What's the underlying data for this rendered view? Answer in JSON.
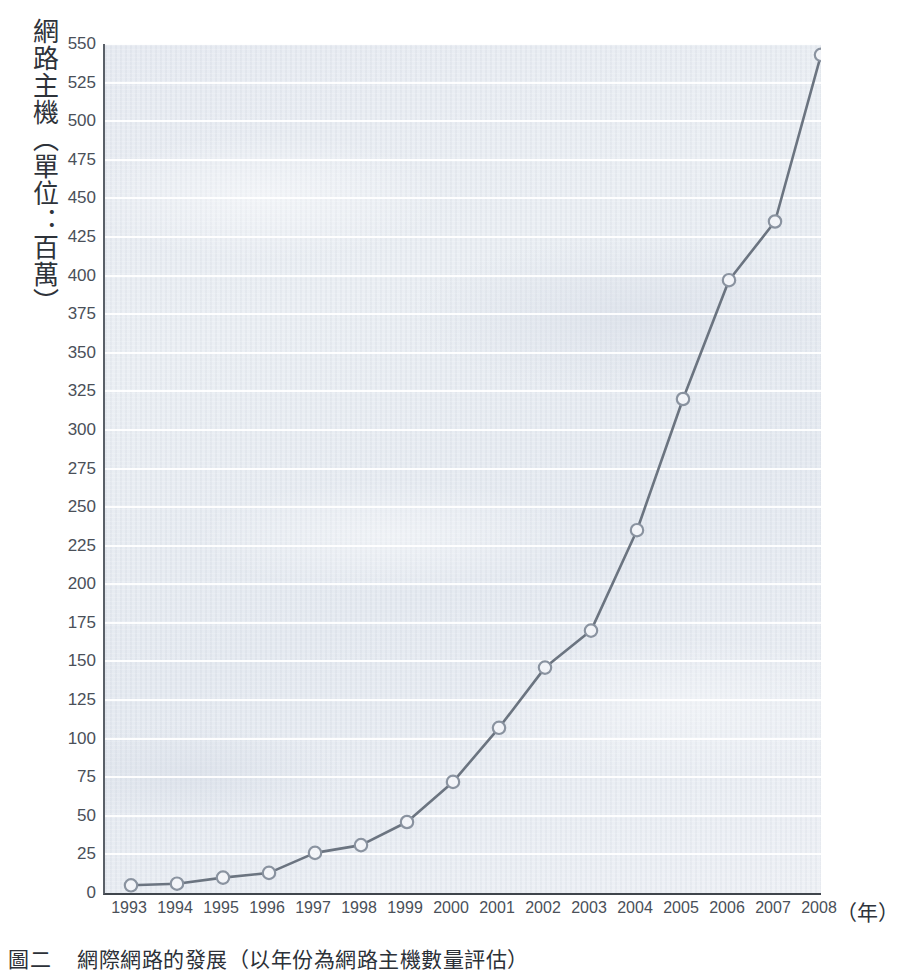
{
  "chart_data": {
    "type": "line",
    "title": "",
    "xlabel": "（年）",
    "ylabel": "網路主機（單位：百萬）",
    "x": [
      1993,
      1994,
      1995,
      1996,
      1997,
      1998,
      1999,
      2000,
      2001,
      2002,
      2003,
      2004,
      2005,
      2006,
      2007,
      2008
    ],
    "categories": [
      "1993",
      "1994",
      "1995",
      "1996",
      "1997",
      "1998",
      "1999",
      "2000",
      "2001",
      "2002",
      "2003",
      "2004",
      "2005",
      "2006",
      "2007",
      "2008"
    ],
    "values": [
      5,
      6,
      10,
      13,
      26,
      31,
      46,
      72,
      107,
      146,
      170,
      235,
      320,
      397,
      435,
      543
    ],
    "series": [
      {
        "name": "網路主機",
        "values": [
          5,
          6,
          10,
          13,
          26,
          31,
          46,
          72,
          107,
          146,
          170,
          235,
          320,
          397,
          435,
          543
        ]
      }
    ],
    "ylim": [
      0,
      550
    ],
    "xlim": [
      1993,
      2008
    ],
    "ytick_step": 25,
    "yticks": [
      0,
      25,
      50,
      75,
      100,
      125,
      150,
      175,
      200,
      225,
      250,
      275,
      300,
      325,
      350,
      375,
      400,
      425,
      450,
      475,
      500,
      525,
      550
    ],
    "ytick_labels": [
      "0",
      "25",
      "50",
      "75",
      "100",
      "125",
      "150",
      "175",
      "200",
      "225",
      "250",
      "275",
      "300",
      "325",
      "350",
      "375",
      "400",
      "425",
      "450",
      "475",
      "500",
      "525",
      "550"
    ],
    "grid": true,
    "grid_orientation": "horizontal",
    "legend": null,
    "legend_position": "none",
    "marker": "circle-open",
    "line_color": "#6b7480",
    "marker_fill": "#f2f4f8",
    "marker_stroke": "#8a93a0",
    "plot_background": "#e8ecf2",
    "gridline_color": "#ffffff",
    "axis_color": "#3f454c"
  },
  "axes": {
    "y_title": "網路主機（單位：百萬）",
    "x_title": "（年）"
  },
  "caption": {
    "label": "圖二",
    "text": "網際網路的發展（以年份為網路主機數量評估）"
  }
}
